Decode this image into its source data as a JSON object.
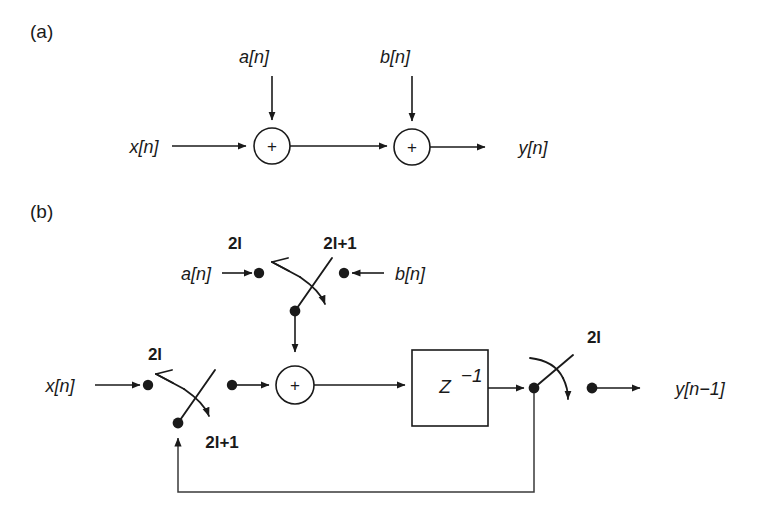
{
  "figure": {
    "width": 763,
    "height": 520,
    "background": "#ffffff",
    "ink_color": "#1a1a1a"
  },
  "panels": [
    {
      "id": "a",
      "label": "(a)",
      "description": "Cascade of two adders: x[n] plus a[n] then plus b[n] yields y[n]"
    },
    {
      "id": "b",
      "label": "(b)",
      "description": "Single adder with z-inverse delay and commutating switches operating at 2l and 2l+1"
    }
  ],
  "panel_a": {
    "label": "(a)",
    "inputs": [
      {
        "name": "x-input-label",
        "text": "x[n]"
      },
      {
        "name": "a-input-label",
        "text": "a[n]"
      },
      {
        "name": "b-input-label",
        "text": "b[n]"
      }
    ],
    "adders": [
      {
        "name": "adder-1",
        "symbol": "+"
      },
      {
        "name": "adder-2",
        "symbol": "+"
      }
    ],
    "output": {
      "name": "y-output-label",
      "text": "y[n]"
    }
  },
  "panel_b": {
    "label": "(b)",
    "inputs": [
      {
        "name": "x-input-label",
        "text": "x[n]"
      },
      {
        "name": "a-input-label",
        "text": "a[n]"
      },
      {
        "name": "b-input-label",
        "text": "b[n]"
      }
    ],
    "switch_labels": [
      {
        "name": "a-branch-phase",
        "text": "2l"
      },
      {
        "name": "b-branch-phase",
        "text": "2l+1"
      },
      {
        "name": "x-branch-phase",
        "text": "2l"
      },
      {
        "name": "feedback-phase",
        "text": "2l+1"
      },
      {
        "name": "output-phase",
        "text": "2l"
      }
    ],
    "adder": {
      "name": "adder",
      "symbol": "+"
    },
    "delay_block": {
      "name": "delay-block",
      "text": "Z",
      "exponent": "−1"
    },
    "output": {
      "name": "y-output-label",
      "text": "y[n−1]"
    }
  }
}
